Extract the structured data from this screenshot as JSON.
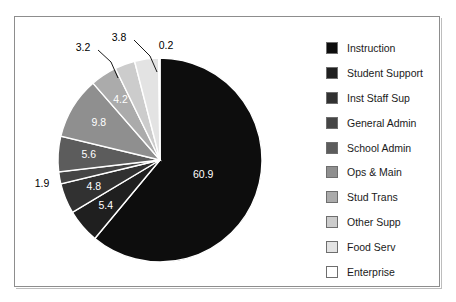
{
  "chart_data": {
    "type": "pie",
    "title": "",
    "legend_position": "right",
    "categories": [
      "Instruction",
      "Student Support",
      "Inst Staff Sup",
      "General Admin",
      "School Admin",
      "Ops & Main",
      "Stud Trans",
      "Other Supp",
      "Food Serv",
      "Enterprise"
    ],
    "values": [
      60.9,
      5.4,
      4.8,
      1.9,
      5.6,
      9.8,
      4.2,
      3.2,
      3.8,
      0.2
    ],
    "value_labels": [
      "60.9",
      "5.4",
      "4.8",
      "1.9",
      "5.6",
      "9.8",
      "4.2",
      "3.2",
      "3.8",
      "0.2"
    ],
    "colors": [
      "#0d0d0d",
      "#1f1f1f",
      "#313131",
      "#454545",
      "#5c5c5c",
      "#8f8f8f",
      "#ababab",
      "#cccccc",
      "#e3e3e3",
      "#ffffff"
    ],
    "label_placement": [
      "inside",
      "inside",
      "inside",
      "outside",
      "inside",
      "inside",
      "inside",
      "outside",
      "outside",
      "outside"
    ],
    "start_angle_deg": 0,
    "direction": "clockwise",
    "slice_border_color": "#ffffff",
    "frame_border_color": "#8d8d8d",
    "background": "#ffffff"
  },
  "legend": {
    "items": [
      {
        "label": "Instruction",
        "color": "#0d0d0d"
      },
      {
        "label": "Student Support",
        "color": "#1f1f1f"
      },
      {
        "label": "Inst Staff Sup",
        "color": "#313131"
      },
      {
        "label": "General Admin",
        "color": "#454545"
      },
      {
        "label": "School Admin",
        "color": "#5c5c5c"
      },
      {
        "label": "Ops & Main",
        "color": "#8f8f8f"
      },
      {
        "label": "Stud Trans",
        "color": "#ababab"
      },
      {
        "label": "Other Supp",
        "color": "#cccccc"
      },
      {
        "label": "Food Serv",
        "color": "#e3e3e3"
      },
      {
        "label": "Enterprise",
        "color": "#ffffff"
      }
    ]
  }
}
